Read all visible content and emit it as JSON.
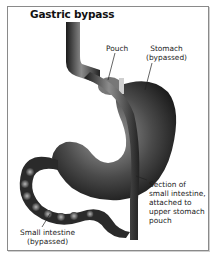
{
  "title": "Gastric bypass",
  "labels": {
    "pouch": "Pouch",
    "stomach_line1": "Stomach",
    "stomach_line2": "(bypassed)",
    "section_line1": "Section of",
    "section_line2": "small intestine,",
    "section_line3": "attached to",
    "section_line4": "upper stomach",
    "section_line5": "pouch",
    "small_line1": "Small intestine",
    "small_line2": "(bypassed)"
  },
  "colors": {
    "border": "#8a8a8a",
    "organ_dark": "#1e1e1e",
    "organ_mid": "#555555",
    "organ_light": "#9a9a9a",
    "text": "#1a1a1a"
  }
}
